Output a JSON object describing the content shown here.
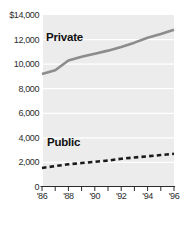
{
  "chart_data": {
    "type": "line",
    "title": "",
    "xlabel": "",
    "ylabel": "",
    "x": [
      1986,
      1987,
      1988,
      1989,
      1990,
      1991,
      1992,
      1993,
      1994,
      1995,
      1996
    ],
    "x_tick_labels": [
      "'86",
      "'88",
      "'90",
      "'92",
      "'94",
      "'96"
    ],
    "x_tick_years": [
      1986,
      1988,
      1990,
      1992,
      1994,
      1996
    ],
    "x_minor_ticks_every_year": true,
    "y_tick_labels": [
      "$14,000",
      "12,000",
      "10,000",
      "8,000",
      "6,000",
      "4,000",
      "2,000",
      "0"
    ],
    "y_tick_values": [
      14000,
      12000,
      10000,
      8000,
      6000,
      4000,
      2000,
      0
    ],
    "ylim": [
      0,
      14000
    ],
    "legend_position": "inline-labels",
    "grid": "horizontal white gridlines on light-gray panel",
    "series": [
      {
        "name": "Private",
        "style": "solid",
        "color": "#8c8c8c",
        "values": [
          9200,
          9500,
          10300,
          10600,
          10850,
          11100,
          11400,
          11750,
          12150,
          12450,
          12800
        ]
      },
      {
        "name": "Public",
        "style": "dashed",
        "color": "#1a1a1a",
        "values": [
          1550,
          1700,
          1850,
          1950,
          2050,
          2150,
          2300,
          2400,
          2500,
          2600,
          2700
        ]
      }
    ],
    "colors": {
      "plot_background": "#ececec",
      "gridline": "#ffffff",
      "axis": "#2a2a2a",
      "tick_label": "#2d2d2d",
      "page_background": "#ffffff"
    }
  }
}
